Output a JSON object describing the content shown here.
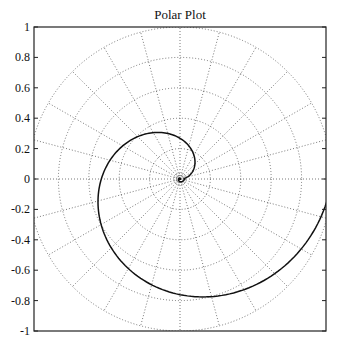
{
  "chart_data": {
    "type": "line",
    "subtype": "polar",
    "title": "Polar Plot",
    "xlabel": "",
    "ylabel": "",
    "ylim": [
      -1,
      1
    ],
    "yticks": [
      -1,
      -0.8,
      -0.6,
      -0.4,
      -0.2,
      0,
      0.2,
      0.4,
      0.6,
      0.8,
      1
    ],
    "ytick_labels": [
      "-1",
      "-0.8",
      "-0.6",
      "-0.4",
      "-0.2",
      "0",
      "0.2",
      "0.4",
      "0.6",
      "0.8",
      "1"
    ],
    "grid": {
      "on": true,
      "style": "dotted",
      "radial_circles": [
        0.2,
        0.4,
        0.6,
        0.8,
        1.0
      ],
      "angular_step_deg": 15
    },
    "series": [
      {
        "name": "spiral",
        "description": "Inward-winding spiral from r=0 at center to r=1 at theta=0 (360 deg)",
        "points_polar": [
          {
            "theta_deg": 90,
            "r": 0.29
          },
          {
            "theta_deg": 180,
            "r": 0.5
          },
          {
            "theta_deg": 270,
            "r": 0.76
          },
          {
            "theta_deg": 360,
            "r": 1.0
          }
        ]
      }
    ],
    "legend": null
  }
}
